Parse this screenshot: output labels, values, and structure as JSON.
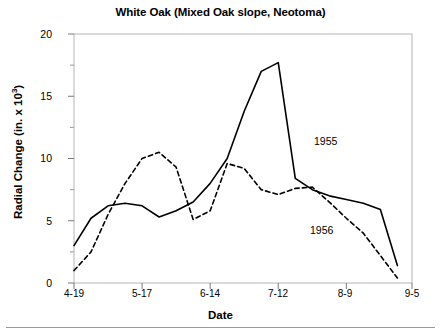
{
  "figure": {
    "title": "White Oak (Mixed Oak slope, Neotoma)",
    "xlabel": "Date",
    "ylabel_main": "Radial Change (in. x 10",
    "ylabel_sup": "3",
    "ylabel_close": ")",
    "ylabel_full": "Radial Change (in. x 10³)",
    "background": "#ffffff",
    "line_color": "#000000"
  },
  "axes": {
    "y_ticks": [
      "20",
      "15",
      "10",
      "5",
      "0"
    ],
    "y_tick_values": [
      20,
      15,
      10,
      5,
      0
    ],
    "y_minor_tick_values": [
      17.5,
      12.5,
      7.5,
      2.5
    ],
    "x_ticks": [
      "4-19",
      "5-17",
      "6-14",
      "7-12",
      "8-9",
      "9-5"
    ],
    "x_tick_days": [
      0,
      28,
      56,
      84,
      112,
      139
    ]
  },
  "series_labels": [
    {
      "name": "label-1955",
      "text": "1955"
    },
    {
      "name": "label-1956",
      "text": "1956"
    }
  ],
  "chart_data": {
    "type": "line",
    "title": "White Oak (Mixed Oak slope, Neotoma)",
    "xlabel": "Date",
    "ylabel": "Radial Change (in. x 10^3)",
    "xlim": [
      0,
      139
    ],
    "ylim": [
      0,
      20
    ],
    "grid": false,
    "legend": "inline-annotations",
    "x_tick_labels": [
      "4-19",
      "5-17",
      "6-14",
      "7-12",
      "8-9",
      "9-5"
    ],
    "x_tick_positions": [
      0,
      28,
      56,
      84,
      112,
      139
    ],
    "y_tick_labels": [
      "0",
      "5",
      "10",
      "15",
      "20"
    ],
    "y_tick_positions": [
      0,
      5,
      10,
      15,
      20
    ],
    "series": [
      {
        "name": "1955",
        "style": "solid",
        "color": "#000000",
        "x": [
          0,
          7,
          14,
          21,
          28,
          35,
          42,
          49,
          56,
          63,
          70,
          77,
          84,
          91,
          98,
          105,
          112,
          119,
          126,
          133
        ],
        "y": [
          3.0,
          5.2,
          6.2,
          6.4,
          6.2,
          5.3,
          5.8,
          6.5,
          8.0,
          10.0,
          13.8,
          17.0,
          17.7,
          8.4,
          7.5,
          7.0,
          6.7,
          6.4,
          5.9,
          1.4
        ]
      },
      {
        "name": "1956",
        "style": "dashed",
        "color": "#000000",
        "x": [
          0,
          7,
          14,
          21,
          28,
          35,
          42,
          49,
          56,
          63,
          70,
          77,
          84,
          91,
          98,
          105,
          112,
          119,
          126,
          133
        ],
        "y": [
          1.0,
          2.5,
          5.5,
          8.0,
          10.0,
          10.5,
          9.3,
          5.1,
          5.8,
          9.6,
          9.2,
          7.5,
          7.1,
          7.6,
          7.7,
          6.5,
          5.2,
          4.0,
          2.2,
          0.4
        ]
      }
    ],
    "annotations": [
      {
        "text": "1955",
        "x": 99,
        "y": 11.1
      },
      {
        "text": "1956",
        "x": 97,
        "y": 4.5
      }
    ]
  }
}
